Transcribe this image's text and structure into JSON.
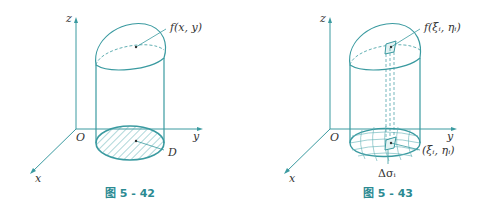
{
  "colors": {
    "stroke": "#3a9aa0",
    "hatch": "#5fb0b5",
    "text": "#333333",
    "caption": "#2b8a92"
  },
  "figures": [
    {
      "caption": "图 5 - 42",
      "axes": {
        "x": "x",
        "y": "y",
        "z": "z",
        "origin": "O"
      },
      "labels": {
        "surface": "f(x, y)",
        "region": "D"
      }
    },
    {
      "caption": "图 5 - 43",
      "axes": {
        "x": "x",
        "y": "y",
        "z": "z",
        "origin": "O"
      },
      "labels": {
        "surface": "f(ξᵢ, ηᵢ)",
        "point": "(ξᵢ, ηᵢ)",
        "area_element": "Δσᵢ"
      }
    }
  ]
}
